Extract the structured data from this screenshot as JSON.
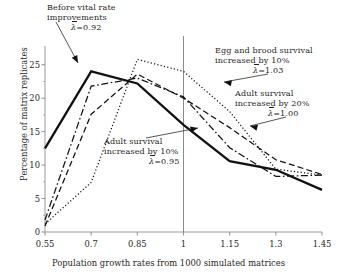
{
  "chart_data": {
    "type": "line",
    "title": "",
    "xlabel": "Population growth rates from 1000 simulated matrices",
    "ylabel": "Percentage of matrix replicates",
    "x": [
      0.55,
      0.7,
      0.85,
      1,
      1.15,
      1.3,
      1.45
    ],
    "xticklabels": [
      "0.55",
      "0.7",
      "0.85",
      "1",
      "1.15",
      "1.3",
      "1.45"
    ],
    "yticklabels": [
      "0",
      "5",
      "10",
      "15",
      "20",
      "25"
    ],
    "yticks": [
      0,
      5,
      10,
      15,
      20,
      25
    ],
    "xlim": [
      0.55,
      1.45
    ],
    "ylim": [
      0,
      27.5
    ],
    "grid": false,
    "legend": "none (inline annotations with leader arrows)",
    "reference_lines": [
      {
        "orientation": "vertical",
        "x": 1
      }
    ],
    "series": [
      {
        "name": "Before vital rate improvements",
        "style": "solid",
        "lambda_bar": "0.92",
        "values": [
          12.5,
          24.0,
          22.2,
          16.0,
          10.6,
          9.3,
          6.3
        ]
      },
      {
        "name": "Adult survival increased by 10%",
        "style": "dash-dot",
        "lambda_bar": "0.95",
        "values": [
          1.8,
          21.8,
          23.0,
          20.2,
          12.6,
          8.3,
          8.5
        ]
      },
      {
        "name": "Adult survival increased by 20%",
        "style": "dashed",
        "lambda_bar": "1.00",
        "values": [
          0.9,
          17.6,
          23.6,
          20.0,
          15.6,
          10.8,
          8.6
        ]
      },
      {
        "name": "Egg and brood survival increased by 10%",
        "style": "dotted",
        "lambda_bar": "1.03",
        "values": [
          1.2,
          7.4,
          25.8,
          24.0,
          18.0,
          9.4,
          8.5
        ]
      }
    ],
    "annotations": [
      {
        "id": "before",
        "line1": "Before vital rate",
        "line2": "improvements",
        "lambda_label": "=0.92",
        "arrow": "points down-right to solid line near x=0.66"
      },
      {
        "id": "egg-brood",
        "line1": "Egg and brood survival",
        "line2": "increased by 10%",
        "lambda_label": "=1.03",
        "arrow": "points left to dotted line near x=1.22"
      },
      {
        "id": "adult-20",
        "line1": "Adult survival",
        "line2": "increased by 20%",
        "lambda_label": "=1.00",
        "arrow": "points left to dashed line near x=1.24"
      },
      {
        "id": "adult-10",
        "line1": "Adult survival",
        "line2": "increased by 10%",
        "lambda_label": "=0.95",
        "arrow": "points right to solid line near x=1.03"
      }
    ]
  },
  "axes": {
    "x_title": "Population growth rates from 1000 simulated matrices",
    "y_title": "Percentage of matrix replicates",
    "x_ticks": [
      "0.55",
      "0.7",
      "0.85",
      "1",
      "1.15",
      "1.3",
      "1.45"
    ],
    "y_ticks": [
      "0",
      "5",
      "10",
      "15",
      "20",
      "25"
    ]
  },
  "symbols": {
    "lambda": "λ"
  }
}
